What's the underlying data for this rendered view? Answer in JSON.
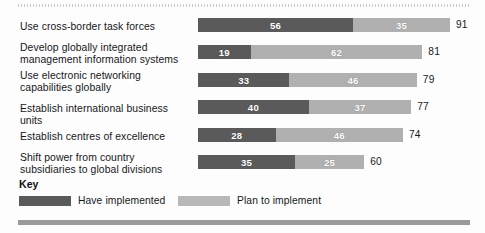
{
  "chart_data": {
    "type": "bar",
    "orientation": "horizontal",
    "stacked": true,
    "title": "",
    "xlabel": "",
    "ylabel": "",
    "xlim": [
      0,
      91
    ],
    "grid": false,
    "legend_position": "bottom-left",
    "categories": [
      "Use cross-border task forces",
      "Develop globally integrated management information systems",
      "Use electronic networking capabilities globally",
      "Establish international business units",
      "Establish centres of excellence",
      "Shift power from country subsidiaries to global divisions"
    ],
    "series": [
      {
        "name": "Have implemented",
        "color": "#5a5a5a",
        "values": [
          56,
          19,
          33,
          40,
          28,
          35
        ]
      },
      {
        "name": "Plan to implement",
        "color": "#b0b0b0",
        "values": [
          35,
          62,
          46,
          37,
          46,
          25
        ]
      }
    ],
    "totals": [
      91,
      81,
      79,
      77,
      74,
      60
    ]
  },
  "rows": [
    {
      "label_lines": [
        "Use cross-border task forces"
      ],
      "implemented": 56,
      "planned": 35,
      "total": 91
    },
    {
      "label_lines": [
        "Develop globally integrated",
        "management information systems"
      ],
      "implemented": 19,
      "planned": 62,
      "total": 81
    },
    {
      "label_lines": [
        "Use electronic networking",
        "capabilities globally"
      ],
      "implemented": 33,
      "planned": 46,
      "total": 79
    },
    {
      "label_lines": [
        "Establish international business units"
      ],
      "implemented": 40,
      "planned": 37,
      "total": 77
    },
    {
      "label_lines": [
        "Establish centres of excellence"
      ],
      "implemented": 28,
      "planned": 46,
      "total": 74
    },
    {
      "label_lines": [
        "Shift power from country",
        "subsidiaries to global divisions"
      ],
      "implemented": 35,
      "planned": 25,
      "total": 60
    }
  ],
  "legend": {
    "title": "Key",
    "implemented_label": "Have implemented",
    "planned_label": "Plan to implement",
    "implemented_color": "#5a5a5a",
    "planned_color": "#b8b8b8"
  }
}
